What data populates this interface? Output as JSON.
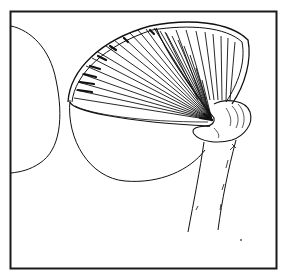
{
  "illustration": {
    "subject": "mushroom line drawing",
    "style": "black ink on white",
    "colors": {
      "ink": "#111111",
      "background": "#ffffff",
      "frame": "#1a1a1a"
    },
    "parts": [
      "frame",
      "left-cap-outline",
      "cap-rim",
      "gills",
      "annulus-ring",
      "stem",
      "speck"
    ]
  }
}
